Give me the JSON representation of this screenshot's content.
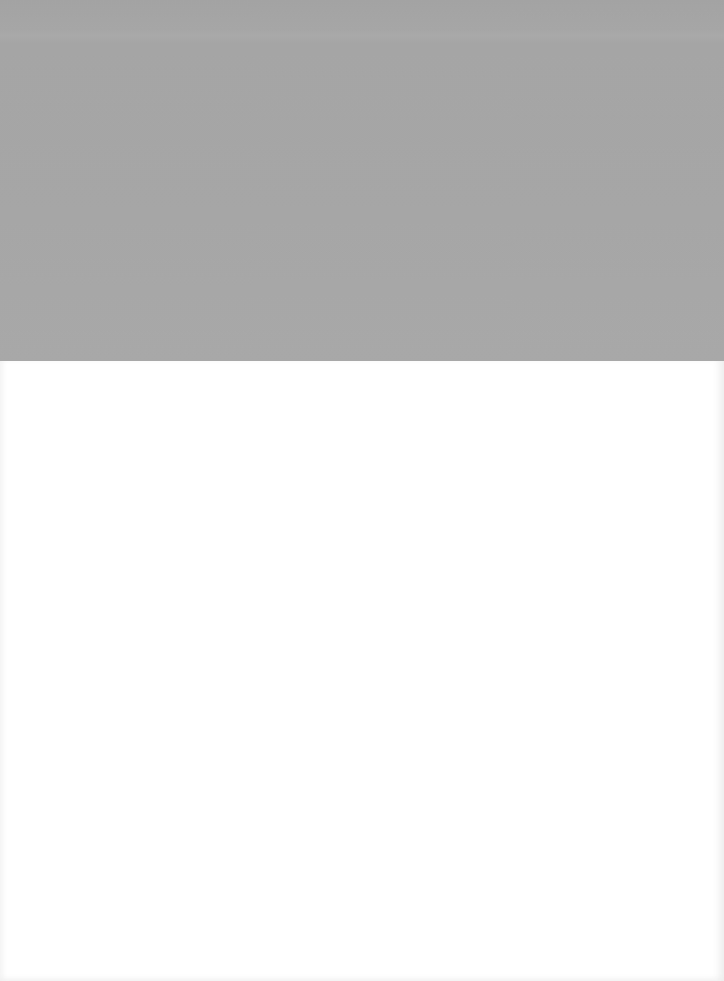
{
  "canvas": {
    "width": 724,
    "height": 981
  },
  "regions": {
    "top_band": {
      "color": "#a6a6a6",
      "height": 361
    },
    "bottom_area": {
      "color": "#ffffff"
    }
  }
}
